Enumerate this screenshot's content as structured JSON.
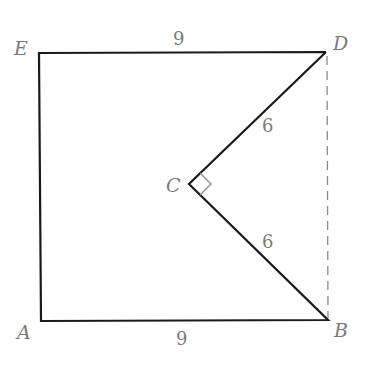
{
  "figure": {
    "points": {
      "A": {
        "label": "A",
        "x": 41,
        "y": 321
      },
      "B": {
        "label": "B",
        "x": 328,
        "y": 320
      },
      "C": {
        "label": "C",
        "x": 189,
        "y": 184
      },
      "D": {
        "label": "D",
        "x": 326,
        "y": 52
      },
      "E": {
        "label": "E",
        "x": 39,
        "y": 53
      }
    },
    "segments": {
      "ED": {
        "label": "9"
      },
      "AB": {
        "label": "9"
      },
      "CD": {
        "label": "6"
      },
      "CB": {
        "label": "6"
      }
    },
    "right_angle_at": "C",
    "dashed_segment": "DB",
    "colors": {
      "stroke": "#1a1a1a",
      "label": "#7a7a7a",
      "dashed": "#8a8a8a"
    }
  }
}
